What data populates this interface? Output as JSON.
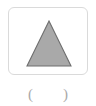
{
  "canvas": {
    "width": 96,
    "height": 106,
    "background_color": "#ffffff"
  },
  "shape_card": {
    "name": "shape-card",
    "background_color": "#ffffff",
    "border_color": "#dadada",
    "corner_radius": 6,
    "shape": {
      "icon_name": "triangle-icon",
      "type": "triangle",
      "fill_color": "#a9a9a9",
      "stroke_color": "#6e6e6e",
      "points": "40,13 62,58 18,58"
    }
  },
  "caption": {
    "name": "answer-blank-caption",
    "open_paren": "(",
    "blank": "",
    "close_paren": ")",
    "full_text": "(    )",
    "text_color": "#a9a9a9"
  }
}
